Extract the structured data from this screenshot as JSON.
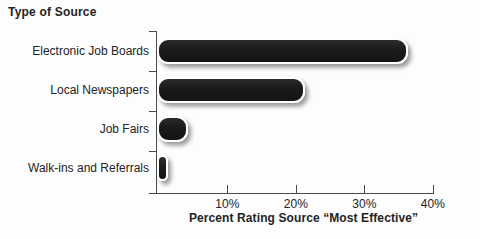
{
  "colors": {
    "bar_fill": "#1d1d1d",
    "bar_outline": "#ffffff",
    "axis": "#4a4a4a",
    "text": "#232323",
    "background": "#fdfdfd"
  },
  "chart_data": {
    "type": "bar",
    "orientation": "horizontal",
    "title": "Type of Source",
    "categories": [
      "Electronic Job Boards",
      "Local Newspapers",
      "Job Fairs",
      "Walk-ins and Referrals"
    ],
    "values": [
      36,
      21,
      4,
      1
    ],
    "unit": "%",
    "xlabel": "Percent Rating Source “Most Effective”",
    "ylabel": "",
    "xlim": [
      0,
      40
    ],
    "xticks": [
      10,
      20,
      30,
      40
    ],
    "xtick_labels": [
      "10%",
      "20%",
      "30%",
      "40%"
    ],
    "grid": false,
    "legend": null
  }
}
